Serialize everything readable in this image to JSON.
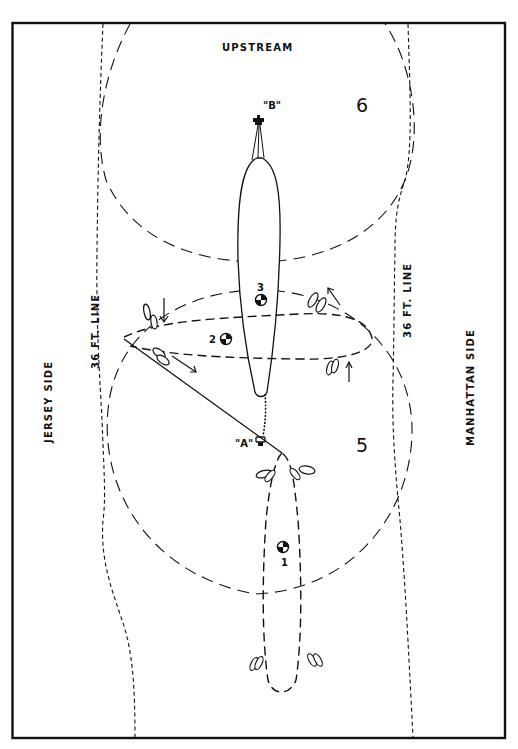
{
  "diagram": {
    "title_top": "UPSTREAM",
    "left_side_label": "JERSEY SIDE",
    "right_side_label": "MANHATTAN SIDE",
    "depth_line_left": "36 FT. LINE",
    "depth_line_right": "36 FT. LINE",
    "anchor_a_label": "\"A\"",
    "anchor_b_label": "\"B\"",
    "circle_5_label": "5",
    "circle_6_label": "6",
    "position_1_label": "1",
    "position_2_label": "2",
    "position_3_label": "3",
    "colors": {
      "ink": "#111111",
      "paper": "#ffffff"
    }
  }
}
